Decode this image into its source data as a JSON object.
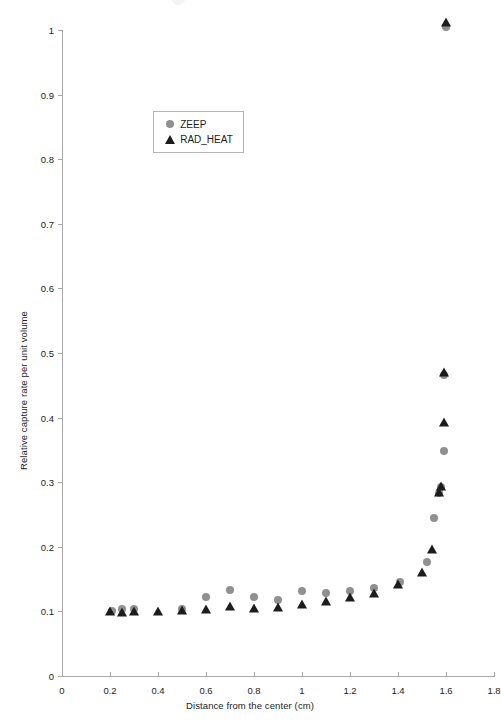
{
  "chart_data": {
    "type": "scatter",
    "title": "",
    "xlabel": "Distance from the center (cm)",
    "ylabel": "Relative capture rate per unit volume",
    "xlim": [
      0,
      1.8
    ],
    "ylim": [
      0,
      1
    ],
    "xticks": [
      "0",
      "0.2",
      "0.4",
      "0.6",
      "0.8",
      "1",
      "1.2",
      "1.4",
      "1.6",
      "1.8"
    ],
    "xtick_values": [
      0,
      0.2,
      0.4,
      0.6,
      0.8,
      1.0,
      1.2,
      1.4,
      1.6,
      1.8
    ],
    "yticks": [
      "0",
      "0.1",
      "0.2",
      "0.3",
      "0.4",
      "0.5",
      "0.6",
      "0.7",
      "0.8",
      "0.9",
      "1"
    ],
    "ytick_values": [
      0,
      0.1,
      0.2,
      0.3,
      0.4,
      0.5,
      0.6,
      0.7,
      0.8,
      0.9,
      1.0
    ],
    "grid": false,
    "legend_position": "upper-left-inside",
    "series": [
      {
        "name": "ZEEP",
        "marker": "circle",
        "color": "#909090",
        "points": [
          [
            0.21,
            0.1
          ],
          [
            0.25,
            0.103
          ],
          [
            0.3,
            0.104
          ],
          [
            0.5,
            0.104
          ],
          [
            0.6,
            0.122
          ],
          [
            0.7,
            0.133
          ],
          [
            0.8,
            0.123
          ],
          [
            0.9,
            0.118
          ],
          [
            1.0,
            0.131
          ],
          [
            1.1,
            0.128
          ],
          [
            1.2,
            0.131
          ],
          [
            1.3,
            0.136
          ],
          [
            1.41,
            0.146
          ],
          [
            1.52,
            0.177
          ],
          [
            1.55,
            0.245
          ],
          [
            1.57,
            0.283
          ],
          [
            1.58,
            0.292
          ],
          [
            1.59,
            0.348
          ],
          [
            1.59,
            0.466
          ],
          [
            1.6,
            1.005
          ]
        ]
      },
      {
        "name": "RAD_HEAT",
        "marker": "triangle",
        "color": "#1c1c1c",
        "points": [
          [
            0.2,
            0.101
          ],
          [
            0.25,
            0.099
          ],
          [
            0.3,
            0.1
          ],
          [
            0.4,
            0.101
          ],
          [
            0.5,
            0.102
          ],
          [
            0.6,
            0.104
          ],
          [
            0.7,
            0.108
          ],
          [
            0.8,
            0.106
          ],
          [
            0.9,
            0.107
          ],
          [
            1.0,
            0.112
          ],
          [
            1.1,
            0.116
          ],
          [
            1.2,
            0.123
          ],
          [
            1.3,
            0.128
          ],
          [
            1.4,
            0.142
          ],
          [
            1.5,
            0.161
          ],
          [
            1.54,
            0.197
          ],
          [
            1.57,
            0.285
          ],
          [
            1.58,
            0.294
          ],
          [
            1.59,
            0.393
          ],
          [
            1.59,
            0.47
          ],
          [
            1.6,
            1.012
          ]
        ]
      }
    ]
  },
  "legend": {
    "entries": [
      {
        "label": "ZEEP",
        "marker": "circle",
        "color": "#909090"
      },
      {
        "label": "RAD_HEAT",
        "marker": "triangle",
        "color": "#1c1c1c"
      }
    ]
  }
}
